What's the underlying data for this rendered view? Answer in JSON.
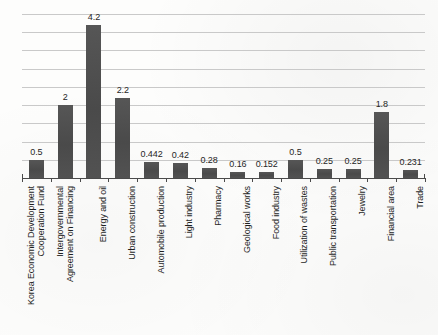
{
  "chart_data": {
    "type": "bar",
    "title": "",
    "subtitle": "",
    "xlabel": "",
    "ylabel": "",
    "ylim": [
      0,
      4.5
    ],
    "grid": true,
    "gridline_step": 0.5,
    "legend": "none",
    "orientation": "vertical",
    "bar_color": "#4e4e4e",
    "gridline_color": "#c9c9c9",
    "axis_color": "#4a4a4a",
    "label_rotation": -90,
    "categories": [
      "Korea Economic Development Cooperation Fund",
      "Intergovernmental Agreement on Financing",
      "Energy and oil",
      "Urban construction",
      "Automobile production",
      "Light industry",
      "Pharmacy",
      "Geological works",
      "Food industry",
      "Utilization of wastes",
      "Public transportation",
      "Jewelry",
      "Financial area",
      "Trade"
    ],
    "category_lines": [
      [
        "Korea Economic Development",
        "Cooperation Fund"
      ],
      [
        "Intergovernmental",
        "Agreement on Financing"
      ],
      [
        "Energy and oil",
        ""
      ],
      [
        "Urban construction",
        ""
      ],
      [
        "Automobile production",
        ""
      ],
      [
        "Light industry",
        ""
      ],
      [
        "Pharmacy",
        ""
      ],
      [
        "Geological works",
        ""
      ],
      [
        "Food industry",
        ""
      ],
      [
        "Utilization of wastes",
        ""
      ],
      [
        "Public transportation",
        ""
      ],
      [
        "Jewelry",
        ""
      ],
      [
        "Financial area",
        ""
      ],
      [
        "Trade",
        ""
      ]
    ],
    "values": [
      0.5,
      2,
      4.2,
      2.2,
      0.442,
      0.42,
      0.28,
      0.16,
      0.152,
      0.5,
      0.25,
      0.25,
      1.8,
      0.231
    ],
    "value_labels": [
      "0.5",
      "2",
      "4.2",
      "2.2",
      "0.442",
      "0.42",
      "0.28",
      "0.16",
      "0.152",
      "0.5",
      "0.25",
      "0.25",
      "1.8",
      "0.231"
    ]
  }
}
